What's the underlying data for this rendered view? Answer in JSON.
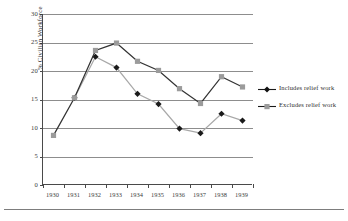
{
  "chart_data": {
    "type": "line",
    "title": "",
    "xlabel": "",
    "ylabel": "% Civilian Workforce",
    "categories": [
      "1930",
      "1931",
      "1932",
      "1933",
      "1934",
      "1935",
      "1936",
      "1937",
      "1938",
      "1939"
    ],
    "x": [
      1930,
      1931,
      1932,
      1933,
      1934,
      1935,
      1936,
      1937,
      1938,
      1939
    ],
    "ylim": [
      0,
      30
    ],
    "yticks": [
      0,
      5,
      10,
      15,
      20,
      25,
      30
    ],
    "ytick_labels": [
      "0",
      "5",
      "10",
      "15",
      "20",
      "25",
      "30"
    ],
    "grid": "horizontal",
    "legend_position": "right",
    "series": [
      {
        "name": "Includes relief work",
        "marker": "diamond",
        "marker_color": "#1a1a1a",
        "line_color": "#a8a8a8",
        "values": [
          null,
          15.3,
          22.5,
          20.6,
          16.0,
          14.2,
          9.9,
          9.1,
          12.5,
          11.3
        ]
      },
      {
        "name": "Excludes relief work",
        "marker": "square",
        "marker_color": "#9b9b9b",
        "line_color": "#333333",
        "values": [
          8.7,
          15.3,
          23.6,
          24.9,
          21.7,
          20.1,
          16.9,
          14.3,
          19.0,
          17.2
        ]
      }
    ]
  },
  "legend": {
    "items": [
      {
        "label": "Includes relief work"
      },
      {
        "label": "Excludes relief work"
      }
    ]
  },
  "colors": {
    "axis": "#4a4a4a",
    "gridline": "#8d8d8d",
    "series_dark": "#333333",
    "series_gray": "#9b9b9b",
    "marker_dark": "#1a1a1a",
    "background": "#ffffff"
  }
}
